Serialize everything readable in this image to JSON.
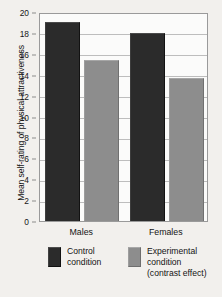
{
  "chart_data": {
    "type": "bar",
    "title": "",
    "subtitle": "",
    "xlabel": "",
    "ylabel": "Mean self-rating of physical attractiveness",
    "categories": [
      "Males",
      "Females"
    ],
    "series": [
      {
        "name": "Control condition",
        "values": [
          19.0,
          18.0
        ],
        "color": "#2b2b2b"
      },
      {
        "name": "Experimental condition (contrast effect)",
        "values": [
          15.4,
          13.7
        ],
        "color": "#8d8d8d"
      }
    ],
    "ylim": [
      0,
      20
    ],
    "ytick_labels": [
      "0",
      "2",
      "4",
      "6",
      "8",
      "10",
      "12",
      "14",
      "16",
      "18",
      "20"
    ],
    "ytick_values": [
      0,
      2,
      4,
      6,
      8,
      10,
      12,
      14,
      16,
      18,
      20
    ],
    "grid": true,
    "legend_position": "bottom"
  },
  "legend": {
    "entries": [
      {
        "label_lines": [
          "Control",
          "condition"
        ],
        "swatch": "control-swatch"
      },
      {
        "label_lines": [
          "Experimental",
          "condition",
          "(contrast effect)"
        ],
        "swatch": "experimental-swatch"
      }
    ]
  },
  "colors": {
    "control": "#2b2b2b",
    "experimental": "#8d8d8d",
    "background": "#f2f0ed",
    "plot_background": "#fbfbfa",
    "gridline": "#bdbdbd",
    "frame": "#9a9a9a"
  }
}
